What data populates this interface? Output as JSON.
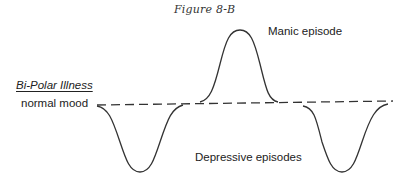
{
  "figure": {
    "title": "Figure 8-B",
    "heading_label": "Bi-Polar Illness",
    "baseline_label": "normal mood",
    "peak_label": "Manic episode",
    "trough_label": "Depressive episodes"
  },
  "diagram": {
    "baseline": {
      "style": "dashed",
      "from": [
        97,
        105
      ],
      "to": [
        393,
        101
      ]
    },
    "episodes": [
      {
        "type": "depressive",
        "start_x": 97,
        "bottom_x": 140,
        "end_x": 183,
        "depth_y": 172
      },
      {
        "type": "manic",
        "start_x": 200,
        "peak_x": 240,
        "end_x": 278,
        "height_y": 30
      },
      {
        "type": "depressive",
        "start_x": 303,
        "bottom_x": 341,
        "end_x": 388,
        "depth_y": 172
      }
    ],
    "colors": {
      "line": "#333333",
      "text": "#222222",
      "background": "#ffffff"
    }
  }
}
